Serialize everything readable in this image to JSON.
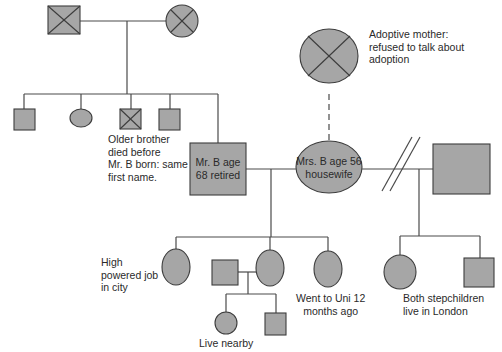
{
  "diagram": {
    "type": "genogram",
    "colors": {
      "symbol_fill": "#a6a6a6",
      "line": "#4a4a4a",
      "text": "#2a2a2a"
    },
    "people": {
      "grandfather": {
        "shape": "square",
        "deceased": true
      },
      "grandmother": {
        "shape": "circle",
        "deceased": true
      },
      "sibling_1": {
        "shape": "square"
      },
      "sibling_2": {
        "shape": "circle"
      },
      "older_brother": {
        "shape": "square",
        "deceased": true
      },
      "sibling_4": {
        "shape": "square"
      },
      "mr_b": {
        "shape": "square",
        "label": "Mr. B age\n68 retired"
      },
      "mrs_b": {
        "shape": "circle",
        "label": "Mrs. B age 56\nhousewife"
      },
      "adoptive_mother": {
        "shape": "circle",
        "deceased": true
      },
      "ex_partner": {
        "shape": "square"
      },
      "daughter_1": {
        "shape": "circle"
      },
      "daughter_2": {
        "shape": "circle"
      },
      "daughter_2_partner": {
        "shape": "square"
      },
      "daughter_3": {
        "shape": "circle"
      },
      "grandchild_1": {
        "shape": "circle"
      },
      "grandchild_2": {
        "shape": "square"
      },
      "stepchild_1": {
        "shape": "circle"
      },
      "stepchild_2": {
        "shape": "square"
      }
    },
    "annotations": {
      "older_brother": "Older brother\ndied before\nMr. B born: same\nfirst name.",
      "adoptive_mother": "Adoptive mother:\nrefused to talk about\nadoption",
      "daughter_1": "High\npowered job\nin city",
      "grandchildren": "Live nearby",
      "daughter_3": "Went to Uni 12\nmonths ago",
      "stepchildren": "Both stepchildren\nlive in London"
    },
    "relationships": [
      {
        "from": "grandfather",
        "to": "grandmother",
        "type": "marriage"
      },
      {
        "from": "mr_b",
        "to": "mrs_b",
        "type": "marriage"
      },
      {
        "from": "mrs_b",
        "to": "ex_partner",
        "type": "divorce"
      },
      {
        "from": "adoptive_mother",
        "to": "mrs_b",
        "type": "adoption"
      },
      {
        "from": "daughter_2_partner",
        "to": "daughter_2",
        "type": "partnership"
      }
    ]
  }
}
